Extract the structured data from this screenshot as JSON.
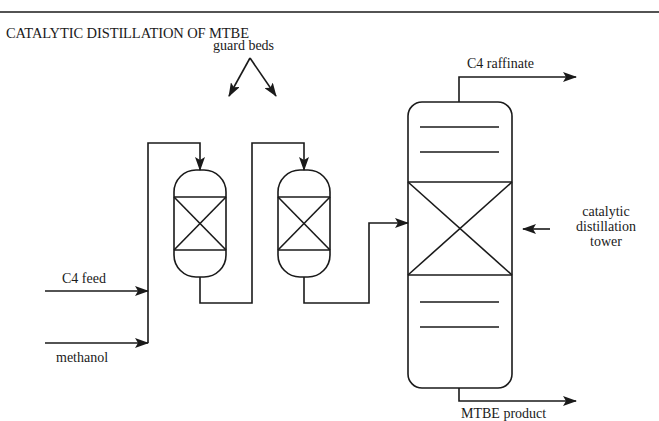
{
  "title": "CATALYTIC DISTILLATION OF MTBE",
  "labels": {
    "guard_beds": "guard beds",
    "c4_feed": "C4 feed",
    "methanol": "methanol",
    "c4_raffinate": "C4 raffinate",
    "mtbe_product": "MTBE product",
    "tower_line1": "catalytic",
    "tower_line2": "distillation",
    "tower_line3": "tower"
  },
  "diagram": {
    "units": [
      {
        "id": "guard-bed-1",
        "type": "packed vessel"
      },
      {
        "id": "guard-bed-2",
        "type": "packed vessel"
      },
      {
        "id": "catalytic-distillation-tower",
        "type": "column with catalyst zone and trays"
      }
    ],
    "streams": [
      {
        "from": "C4 feed",
        "to": "guard-bed-1"
      },
      {
        "from": "methanol",
        "to": "guard-bed-1"
      },
      {
        "from": "guard-bed-1",
        "to": "guard-bed-2"
      },
      {
        "from": "guard-bed-2",
        "to": "catalytic-distillation-tower"
      },
      {
        "from": "catalytic-distillation-tower",
        "to": "C4 raffinate"
      },
      {
        "from": "catalytic-distillation-tower",
        "to": "MTBE product"
      }
    ],
    "colors": {
      "line": "#1a1a1a",
      "background": "#ffffff"
    }
  }
}
